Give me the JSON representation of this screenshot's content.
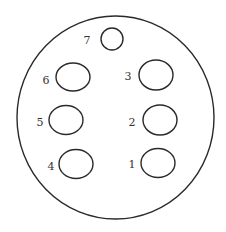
{
  "diagram": {
    "type": "connector-pinout",
    "stroke_color": "#2a2a2a",
    "label_color": "#333333",
    "background": "#ffffff",
    "outline": {
      "cx": 115.5,
      "cy": 117.5,
      "rx": 98.5,
      "ry": 101.5
    },
    "pins": [
      {
        "id": "1",
        "label": "1",
        "cx": 158,
        "cy": 163,
        "rx": 17,
        "ry": 14.5,
        "label_x": 132,
        "label_y": 168
      },
      {
        "id": "2",
        "label": "2",
        "cx": 160,
        "cy": 120,
        "rx": 17,
        "ry": 15,
        "label_x": 132,
        "label_y": 126
      },
      {
        "id": "3",
        "label": "3",
        "cx": 156,
        "cy": 75,
        "rx": 17,
        "ry": 15,
        "label_x": 128,
        "label_y": 80
      },
      {
        "id": "4",
        "label": "4",
        "cx": 76,
        "cy": 164,
        "rx": 17,
        "ry": 14.5,
        "label_x": 51,
        "label_y": 170
      },
      {
        "id": "5",
        "label": "5",
        "cx": 66,
        "cy": 120,
        "rx": 17,
        "ry": 14.5,
        "label_x": 40,
        "label_y": 126
      },
      {
        "id": "6",
        "label": "6",
        "cx": 73,
        "cy": 77,
        "rx": 17,
        "ry": 14,
        "label_x": 46,
        "label_y": 84
      },
      {
        "id": "7",
        "label": "7",
        "cx": 112,
        "cy": 39,
        "rx": 11,
        "ry": 11,
        "label_x": 87,
        "label_y": 44
      }
    ]
  }
}
